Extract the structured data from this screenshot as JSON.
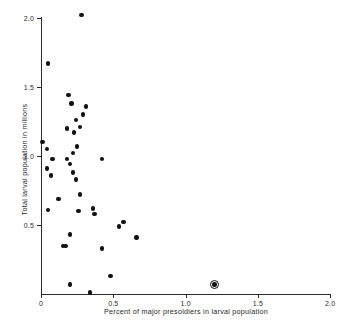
{
  "chart_data": {
    "type": "scatter",
    "title": "",
    "xlabel": "Percent of major presoldiers in larval population",
    "ylabel": "Total larval population in millions",
    "xlim": [
      0,
      2.0
    ],
    "ylim": [
      0,
      2.1
    ],
    "xticks": [
      "0",
      "0.5",
      "1.0",
      "1.5",
      "2.0"
    ],
    "xtick_values": [
      0,
      0.5,
      1.0,
      1.5,
      2.0
    ],
    "yticks": [
      "0.5",
      "1.0",
      "1.5",
      "2.0"
    ],
    "ytick_values": [
      0.5,
      1.0,
      1.5,
      2.0
    ],
    "grid": false,
    "legend": "none",
    "marker": "filled-circle",
    "marker_color": "#111111",
    "points": [
      {
        "x": 0.28,
        "y": 2.02
      },
      {
        "x": 0.05,
        "y": 1.67
      },
      {
        "x": 0.19,
        "y": 1.44
      },
      {
        "x": 0.21,
        "y": 1.38
      },
      {
        "x": 0.31,
        "y": 1.36
      },
      {
        "x": 0.29,
        "y": 1.3
      },
      {
        "x": 0.24,
        "y": 1.26
      },
      {
        "x": 0.27,
        "y": 1.21
      },
      {
        "x": 0.18,
        "y": 1.2
      },
      {
        "x": 0.23,
        "y": 1.17
      },
      {
        "x": 0.01,
        "y": 1.1
      },
      {
        "x": 0.25,
        "y": 1.07
      },
      {
        "x": 0.04,
        "y": 1.05
      },
      {
        "x": 0.22,
        "y": 1.02
      },
      {
        "x": 0.08,
        "y": 0.98
      },
      {
        "x": 0.18,
        "y": 0.98
      },
      {
        "x": 0.42,
        "y": 0.98
      },
      {
        "x": 0.2,
        "y": 0.94
      },
      {
        "x": 0.04,
        "y": 0.91
      },
      {
        "x": 0.22,
        "y": 0.88
      },
      {
        "x": 0.07,
        "y": 0.86
      },
      {
        "x": 0.24,
        "y": 0.83
      },
      {
        "x": 0.27,
        "y": 0.72
      },
      {
        "x": 0.12,
        "y": 0.69
      },
      {
        "x": 0.36,
        "y": 0.62
      },
      {
        "x": 0.05,
        "y": 0.61
      },
      {
        "x": 0.26,
        "y": 0.6
      },
      {
        "x": 0.37,
        "y": 0.58
      },
      {
        "x": 0.57,
        "y": 0.52
      },
      {
        "x": 0.54,
        "y": 0.49
      },
      {
        "x": 0.2,
        "y": 0.43
      },
      {
        "x": 0.66,
        "y": 0.41
      },
      {
        "x": 0.15,
        "y": 0.35
      },
      {
        "x": 0.17,
        "y": 0.35
      },
      {
        "x": 0.42,
        "y": 0.33
      },
      {
        "x": 0.48,
        "y": 0.13
      },
      {
        "x": 0.2,
        "y": 0.07
      },
      {
        "x": 1.2,
        "y": 0.07,
        "highlighted": true
      },
      {
        "x": 0.34,
        "y": 0.01
      }
    ],
    "highlighted_point": {
      "x": 1.2,
      "y": 0.07,
      "note": "circled outlier"
    }
  }
}
